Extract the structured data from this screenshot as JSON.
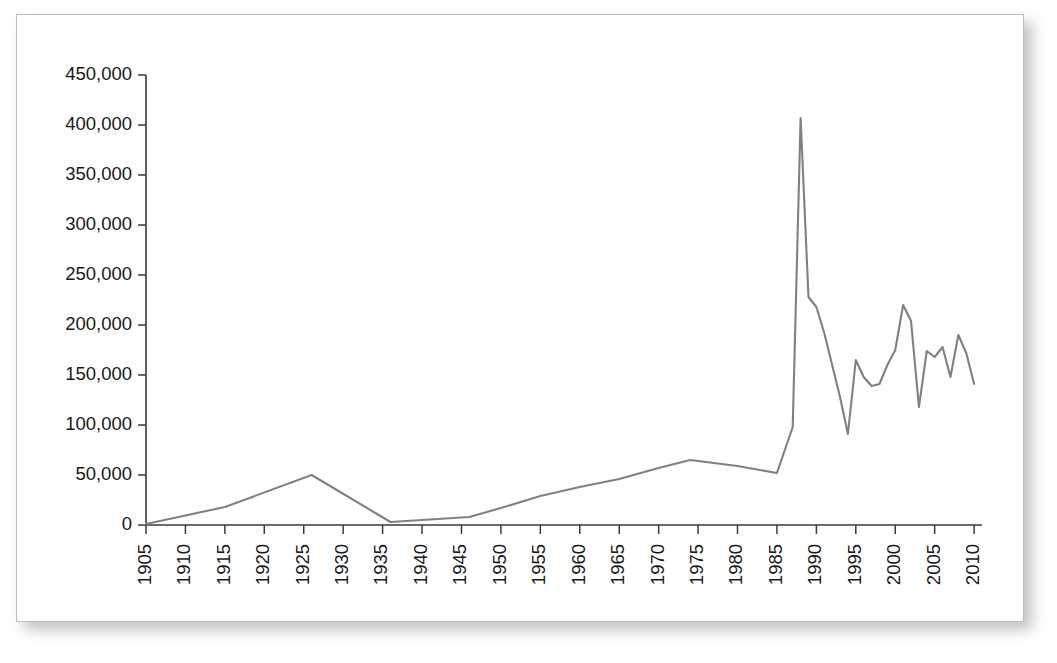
{
  "chart_data": {
    "type": "line",
    "title": "",
    "subtitle": "",
    "xlabel": "",
    "ylabel": "",
    "xlim": [
      1905,
      2011
    ],
    "ylim": [
      0,
      450000
    ],
    "grid": false,
    "legend": null,
    "legend_position": "none",
    "line_color": "#808080",
    "axis_color": "#3a3a3a",
    "y_ticks": [
      0,
      50000,
      100000,
      150000,
      200000,
      250000,
      300000,
      350000,
      400000,
      450000
    ],
    "y_tick_labels": [
      "0",
      "50,000",
      "100,000",
      "150,000",
      "200,000",
      "250,000",
      "300,000",
      "350,000",
      "400,000",
      "450,000"
    ],
    "x_ticks": [
      1905,
      1910,
      1915,
      1920,
      1925,
      1930,
      1935,
      1940,
      1945,
      1950,
      1955,
      1960,
      1965,
      1970,
      1975,
      1980,
      1985,
      1990,
      1995,
      2000,
      2005,
      2010
    ],
    "x_tick_labels": [
      "1905",
      "1910",
      "1915",
      "1920",
      "1925",
      "1930",
      "1935",
      "1940",
      "1945",
      "1950",
      "1955",
      "1960",
      "1965",
      "1970",
      "1975",
      "1980",
      "1985",
      "1990",
      "1995",
      "2000",
      "2005",
      "2010"
    ],
    "x_tick_label_rotation": -90,
    "series": [
      {
        "name": "series-1",
        "color": "#808080",
        "x": [
          1905,
          1915,
          1926,
          1936,
          1940,
          1946,
          1950,
          1955,
          1960,
          1965,
          1970,
          1974,
          1980,
          1985,
          1987,
          1988,
          1989,
          1990,
          1991,
          1992,
          1993,
          1994,
          1995,
          1996,
          1997,
          1998,
          1999,
          2000,
          2001,
          2002,
          2003,
          2004,
          2005,
          2006,
          2007,
          2008,
          2009,
          2010
        ],
        "y": [
          1000,
          18000,
          50000,
          3000,
          5000,
          8000,
          17000,
          29000,
          38000,
          46000,
          57000,
          65000,
          59000,
          52000,
          98000,
          407000,
          228000,
          218000,
          192000,
          160000,
          128000,
          91000,
          165000,
          148000,
          139000,
          141000,
          160000,
          175000,
          220000,
          204000,
          118000,
          174000,
          168000,
          178000,
          148000,
          190000,
          172000,
          141000
        ]
      }
    ]
  }
}
